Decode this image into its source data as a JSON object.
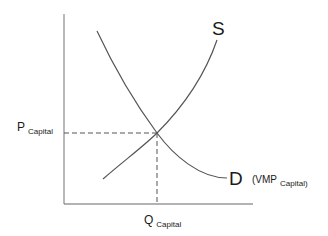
{
  "diagram": {
    "type": "supply-demand",
    "curves": {
      "supply": {
        "label": "S"
      },
      "demand": {
        "label": "D",
        "annotation_prefix": "(VMP",
        "annotation_sub": "Capital)"
      }
    },
    "axes": {
      "y_label_main": "P",
      "y_label_sub": "Capital",
      "x_label_main": "Q",
      "x_label_sub": "Capital"
    },
    "colors": {
      "line": "#555555",
      "text": "#1a1a1a",
      "background": "#ffffff"
    }
  }
}
